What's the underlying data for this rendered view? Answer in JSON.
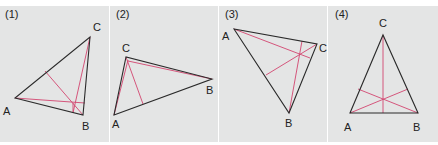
{
  "colors": {
    "background": "#e4e5e5",
    "triangle": "#2a2a2a",
    "altitude": "#d2456f"
  },
  "panels": [
    {
      "label": "(1)",
      "vertices": {
        "A": [
          15,
          98
        ],
        "B": [
          83,
          115
        ],
        "C": [
          90,
          37
        ]
      }
    },
    {
      "label": "(2)",
      "vertices": {
        "A": [
          114,
          115
        ],
        "B": [
          212,
          79
        ],
        "C": [
          126,
          57
        ]
      }
    },
    {
      "label": "(3)",
      "vertices": {
        "A": [
          234,
          29
        ],
        "B": [
          289,
          113
        ],
        "C": [
          317,
          44
        ]
      }
    },
    {
      "label": "(4)",
      "vertices": {
        "A": [
          350,
          113
        ],
        "B": [
          418,
          113
        ],
        "C": [
          383,
          35
        ]
      }
    }
  ],
  "vertex_labels": {
    "A": "A",
    "B": "B",
    "C": "C"
  }
}
